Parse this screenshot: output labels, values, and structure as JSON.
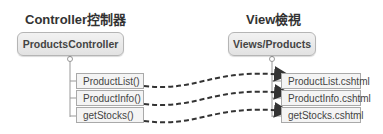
{
  "controller": {
    "title": "Controller控制器",
    "root": "ProductsController",
    "methods": [
      "ProductList()",
      "ProductInfo()",
      "getStocks()"
    ]
  },
  "view": {
    "title": "View檢視",
    "root": "Views/Products",
    "files": [
      "ProductList.cshtml",
      "ProductInfo.cshtml",
      "getStocks.cshtml"
    ]
  },
  "colors": {
    "arrow": "#333333",
    "border": "#a9a9a9",
    "box_fill": "#f4f4f4"
  }
}
